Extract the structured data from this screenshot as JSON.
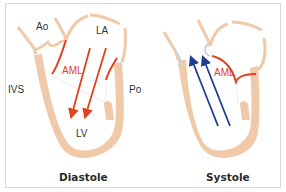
{
  "panels": [
    {
      "title": "Diastole",
      "labels": {
        "aorta": "Ao",
        "left_atrium": "LA",
        "anterior_mitral_leaflet": "AML",
        "interventricular_septum": "IVS",
        "posterior_leaflet": "Po",
        "left_ventricle": "LV"
      },
      "flow_direction": "LA to LV (downward)",
      "flow_color": "#e2401e"
    },
    {
      "title": "Systole",
      "labels": {
        "anterior_mitral_leaflet": "AML"
      },
      "flow_direction": "LV to Ao (upward)",
      "flow_color": "#1f3f8f"
    }
  ],
  "colors": {
    "myocardium": "#efc9a8",
    "leaflet": "#e2401e",
    "aortic_valve": "#c8d3e6",
    "frame_border": "#d9d9d9"
  }
}
